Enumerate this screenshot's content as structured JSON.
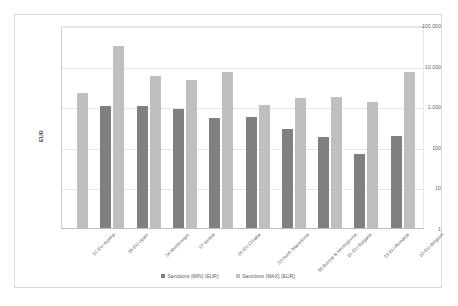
{
  "chart_data": {
    "type": "bar",
    "title": "",
    "xlabel": "",
    "ylabel": "EUR",
    "yscale": "log",
    "ylim": [
      1,
      100000
    ],
    "yticks": [
      1,
      10,
      100,
      1000,
      10000,
      100000
    ],
    "ytick_labels": [
      "1",
      "10",
      "100",
      "1.000",
      "10.000",
      "100.000"
    ],
    "grid": true,
    "legend_position": "bottom",
    "categories": [
      "01-EU-Austria",
      "26-EU-Spain",
      "34-Montenegro",
      "37-Serbia",
      "04-EU-Croatia",
      "33-North Macedonia",
      "30-Bosnia & Herzegovina",
      "01-EU-Bulgaria",
      "23-EU-Romania",
      "02-EU-Belgium"
    ],
    "series": [
      {
        "name": "Sanctions (MIN) (EUR)",
        "color": "#808080",
        "values": [
          null,
          1000,
          1000,
          850,
          500,
          530,
          270,
          170,
          65,
          180
        ]
      },
      {
        "name": "Sanctions (MAX) (EUR)",
        "color": "#bfbfbf",
        "values": [
          2100,
          30000,
          5500,
          4300,
          6800,
          1100,
          1600,
          1700,
          1300,
          7000
        ]
      }
    ]
  },
  "legend": {
    "items": [
      {
        "label": "Sanctions (MIN) (EUR)",
        "color": "#808080"
      },
      {
        "label": "Sanctions (MAX) (EUR)",
        "color": "#bfbfbf"
      }
    ]
  },
  "axis": {
    "y_title": "EUR"
  }
}
